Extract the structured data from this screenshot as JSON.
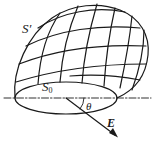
{
  "figure": {
    "type": "physics-diagram",
    "labels": {
      "curved_surface": "S′",
      "flat_surface_main": "S",
      "flat_surface_sub": "0",
      "angle": "θ",
      "field": "E"
    },
    "colors": {
      "stroke": "#1a1a1a",
      "background": "#ffffff"
    }
  }
}
